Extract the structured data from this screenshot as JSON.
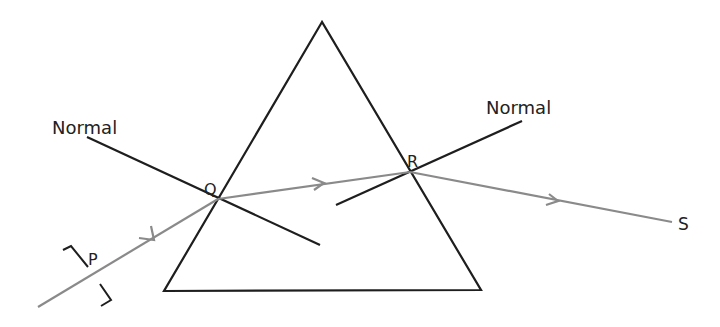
{
  "diagram": {
    "type": "prism-refraction",
    "labels": {
      "normal_left": "Normal",
      "normal_right": "Normal",
      "point_p": "P",
      "point_q": "Q",
      "point_r": "R",
      "point_s": "S"
    },
    "colors": {
      "prism": "#1e1e1e",
      "normal": "#1e1e1e",
      "ray": "#8a8a8a",
      "text": "#222222",
      "background": "#ffffff"
    },
    "geometry": {
      "prism": {
        "apex": [
          322,
          22
        ],
        "base_left": [
          164,
          291
        ],
        "base_right": [
          481,
          290
        ]
      },
      "incident_ray": {
        "from": [
          38,
          307
        ],
        "to": [
          218,
          199
        ]
      },
      "refracted_ray": {
        "from": [
          218,
          199
        ],
        "to": [
          410,
          172
        ]
      },
      "emergent_ray": {
        "from": [
          410,
          172
        ],
        "to": [
          672,
          222
        ]
      },
      "normal_at_q": {
        "from": [
          87,
          137
        ],
        "to": [
          320,
          245
        ]
      },
      "normal_at_r": {
        "from": [
          336,
          205
        ],
        "to": [
          522,
          121
        ]
      }
    }
  }
}
